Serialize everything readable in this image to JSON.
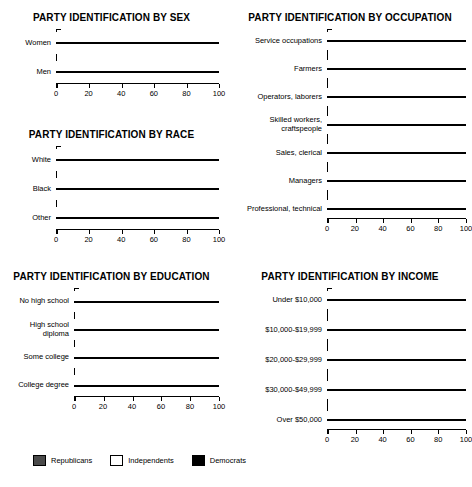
{
  "legend": {
    "items": [
      {
        "label": "Republicans",
        "swatch": "republican-swatch",
        "color": "#4a4a4a"
      },
      {
        "label": "Independents",
        "swatch": "independent-swatch",
        "color": "#ffffff"
      },
      {
        "label": "Democrats",
        "swatch": "democrat-swatch",
        "color": "#000000"
      }
    ]
  },
  "axis": {
    "ticks": [
      "0",
      "20",
      "40",
      "60",
      "80",
      "100"
    ],
    "tick_values": [
      0,
      20,
      40,
      60,
      80,
      100
    ],
    "min": 0,
    "max": 100
  },
  "chart_data": [
    {
      "id": "sex",
      "type": "bar",
      "orientation": "horizontal",
      "stacked": true,
      "title": "PARTY IDENTIFICATION BY SEX",
      "xlabel": "",
      "ylabel": "",
      "xlim": [
        0,
        100
      ],
      "grid": false,
      "legend_position": "bottom",
      "categories": [
        "Women",
        "Men"
      ],
      "series": [
        {
          "name": "Democrats",
          "color": "#000000",
          "values": [
            42,
            37
          ]
        },
        {
          "name": "Independents",
          "color": "#ffffff",
          "values": [
            31,
            33
          ]
        },
        {
          "name": "Republicans",
          "color": "#4a4a4a",
          "values": [
            27,
            30
          ]
        }
      ]
    },
    {
      "id": "race",
      "type": "bar",
      "orientation": "horizontal",
      "stacked": true,
      "title": "PARTY IDENTIFICATION BY RACE",
      "xlabel": "",
      "ylabel": "",
      "xlim": [
        0,
        100
      ],
      "grid": false,
      "legend_position": "bottom",
      "categories": [
        "White",
        "Black",
        "Other"
      ],
      "series": [
        {
          "name": "Democrats",
          "color": "#000000",
          "values": [
            36,
            67,
            47
          ]
        },
        {
          "name": "Independents",
          "color": "#ffffff",
          "values": [
            30,
            23,
            40
          ]
        },
        {
          "name": "Republicans",
          "color": "#4a4a4a",
          "values": [
            34,
            10,
            13
          ]
        }
      ]
    },
    {
      "id": "education",
      "type": "bar",
      "orientation": "horizontal",
      "stacked": true,
      "title": "PARTY IDENTIFICATION BY EDUCATION",
      "xlabel": "",
      "ylabel": "",
      "xlim": [
        0,
        100
      ],
      "grid": false,
      "legend_position": "bottom",
      "categories": [
        "No high school",
        "High school\ndiploma",
        "Some college",
        "College degree"
      ],
      "series": [
        {
          "name": "Democrats",
          "color": "#000000",
          "values": [
            48,
            37,
            31,
            39
          ]
        },
        {
          "name": "Independents",
          "color": "#ffffff",
          "values": [
            30,
            30,
            32,
            30
          ]
        },
        {
          "name": "Republicans",
          "color": "#4a4a4a",
          "values": [
            22,
            33,
            37,
            31
          ]
        }
      ]
    },
    {
      "id": "occupation",
      "type": "bar",
      "orientation": "horizontal",
      "stacked": true,
      "title": "PARTY IDENTIFICATION BY OCCUPATION",
      "xlabel": "",
      "ylabel": "",
      "xlim": [
        0,
        100
      ],
      "grid": false,
      "legend_position": "bottom",
      "categories": [
        "Service occupations",
        "Farmers",
        "Operators, laborers",
        "Skilled workers, craftspeople",
        "Sales, clerical",
        "Managers",
        "Professional, technical"
      ],
      "series": [
        {
          "name": "Democrats",
          "color": "#000000",
          "values": [
            45,
            40,
            38,
            28,
            33,
            27,
            30
          ]
        },
        {
          "name": "Independents",
          "color": "#ffffff",
          "values": [
            33,
            45,
            35,
            37,
            30,
            36,
            32
          ]
        },
        {
          "name": "Republicans",
          "color": "#4a4a4a",
          "values": [
            22,
            15,
            27,
            35,
            37,
            37,
            38
          ]
        }
      ]
    },
    {
      "id": "income",
      "type": "bar",
      "orientation": "horizontal",
      "stacked": true,
      "title": "PARTY IDENTIFICATION BY INCOME",
      "xlabel": "",
      "ylabel": "",
      "xlim": [
        0,
        100
      ],
      "grid": false,
      "legend_position": "bottom",
      "categories": [
        "Under $10,000",
        "$10,000-$19,999",
        "$20,000-$29,999",
        "$30,000-$49,999",
        "Over $50,000"
      ],
      "series": [
        {
          "name": "Democrats",
          "color": "#000000",
          "values": [
            42,
            47,
            35,
            32,
            27
          ]
        },
        {
          "name": "Independents",
          "color": "#ffffff",
          "values": [
            35,
            26,
            33,
            36,
            33
          ]
        },
        {
          "name": "Republicans",
          "color": "#4a4a4a",
          "values": [
            23,
            27,
            32,
            32,
            40
          ]
        }
      ]
    }
  ]
}
